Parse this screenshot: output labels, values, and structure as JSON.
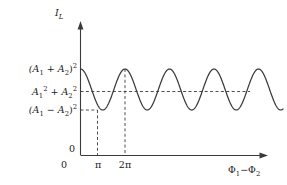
{
  "figure": {
    "type": "line-plot",
    "background": "#ffffff",
    "ink_color": "#3a3a3a",
    "text_color": "#1a1a1a"
  },
  "axes": {
    "y_axis_title": "I",
    "y_axis_title_sub": "L",
    "x_axis_title_part1": "Φ",
    "x_axis_title_sub1": "1",
    "x_axis_title_dash": "−",
    "x_axis_title_part2": "Φ",
    "x_axis_title_sub2": "2",
    "origin_label_y": "0",
    "origin_label_x": "0"
  },
  "y_ticks": [
    {
      "id": "max-level",
      "prefix": "(A",
      "sub1": "1",
      "op": " + A",
      "sub2": "2",
      "suffix": ")",
      "exp": "2",
      "form": "paren",
      "value_label": "(A₁ + A₂)²"
    },
    {
      "id": "mid-level",
      "prefix": "A",
      "sub1": "1",
      "exp1": "2",
      "op": " + A",
      "sub2": "2",
      "exp2": "2",
      "form": "sum",
      "value_label": "A₁² + A₂²"
    },
    {
      "id": "min-level",
      "prefix": "(A",
      "sub1": "1",
      "op": " − A",
      "sub2": "2",
      "suffix": ")",
      "exp": "2",
      "form": "paren",
      "value_label": "(A₁ − A₂)²"
    }
  ],
  "x_ticks": [
    {
      "id": "tick-0",
      "label": "0"
    },
    {
      "id": "tick-pi",
      "label": "π"
    },
    {
      "id": "tick-2pi",
      "label": "2π"
    }
  ],
  "chart_data": {
    "type": "line",
    "title": "",
    "subtitle": "",
    "xlabel": "Φ₁ − Φ₂",
    "ylabel": "I_L",
    "grid": false,
    "legend": null,
    "function": "I_L = A1^2 + A2^2 + 2*A1*A2*cos(phi1 - phi2)",
    "xlim": [
      0,
      8.8
    ],
    "ylim_labels": {
      "min": "(A₁ − A₂)²",
      "mid": "A₁² + A₂²",
      "max": "(A₁ + A₂)²",
      "zero": "0"
    },
    "xtick_values": [
      0,
      3.14159,
      6.28318
    ],
    "xtick_labels": [
      "0",
      "π",
      "2π"
    ],
    "maxima_x": [
      0,
      6.28318
    ],
    "minima_x": [
      3.14159
    ],
    "period": 6.28318,
    "amplitude_normalized": 1.0,
    "annotations": [
      {
        "id": "midline",
        "type": "horizontal-dashed",
        "level": "A₁² + A₂²"
      },
      {
        "id": "minline",
        "type": "horizontal-dashed",
        "level": "(A₁ − A₂)²"
      },
      {
        "id": "vline-pi",
        "type": "vertical-dashed",
        "at": "π"
      },
      {
        "id": "vline-2pi",
        "type": "vertical-dashed",
        "at": "2π"
      }
    ]
  }
}
